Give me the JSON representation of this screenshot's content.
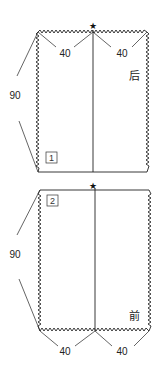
{
  "diagram": {
    "type": "sewing-pattern",
    "pieces": [
      {
        "id": 1,
        "number_label": "1",
        "name_label": "后",
        "width_labels": [
          "40",
          "40"
        ],
        "height_label": "90",
        "marker": "★"
      },
      {
        "id": 2,
        "number_label": "2",
        "name_label": "前",
        "width_labels": [
          "40",
          "40"
        ],
        "height_label": "90",
        "marker": "★"
      }
    ],
    "colors": {
      "line": "#222222",
      "background": "#ffffff"
    }
  }
}
